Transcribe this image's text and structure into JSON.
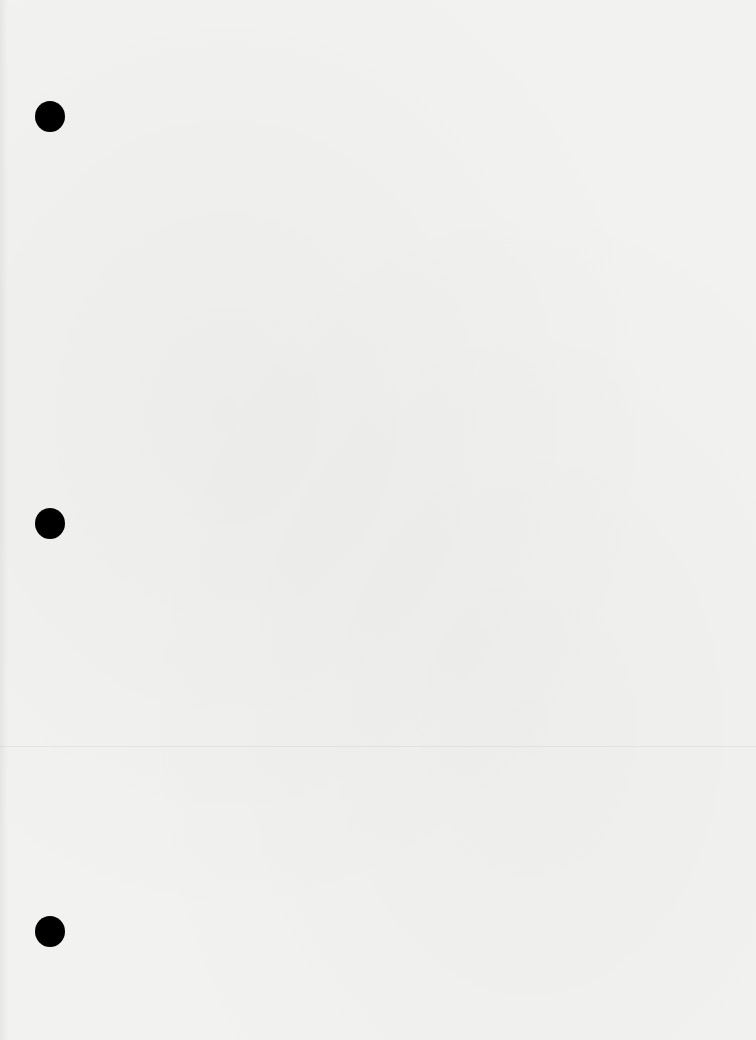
{
  "document": {
    "type": "blank hole-punched sheet",
    "background_color": "#f2f2f1",
    "punch_holes": [
      {
        "x": 50,
        "y": 116,
        "color": "#000000"
      },
      {
        "x": 50,
        "y": 523,
        "color": "#000000"
      },
      {
        "x": 50,
        "y": 931,
        "color": "#000000"
      }
    ]
  }
}
